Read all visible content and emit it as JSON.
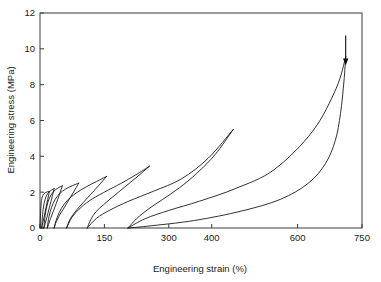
{
  "chart_data": {
    "type": "line",
    "title": "",
    "xlabel": "Engineering strain (%)",
    "ylabel": "Engineering stress (MPa)",
    "xlim": [
      0,
      750
    ],
    "ylim": [
      0,
      12
    ],
    "xticks": [
      0,
      150,
      300,
      400,
      600,
      750
    ],
    "xtick_labels": [
      "0",
      "150",
      "300",
      "400",
      "600",
      "750"
    ],
    "yticks": [
      0,
      2,
      4,
      6,
      8,
      10,
      12
    ],
    "ytick_labels": [
      "0",
      "2",
      "4",
      "6",
      "8",
      "10",
      "12"
    ],
    "grid": false,
    "legend": false,
    "annotations": [
      {
        "name": "unload-arrow",
        "x": 712,
        "y": 9.3,
        "direction": "down"
      }
    ],
    "series": [
      {
        "name": "cycle-1",
        "peak_strain": 22,
        "peak_stress": 2.05,
        "residual_strain": 4,
        "loading": [
          [
            0,
            0
          ],
          [
            1.5,
            0.9
          ],
          [
            3,
            1.45
          ],
          [
            5,
            1.72
          ],
          [
            8,
            1.88
          ],
          [
            12,
            1.97
          ],
          [
            17,
            2.02
          ],
          [
            22,
            2.05
          ]
        ],
        "unloading": [
          [
            22,
            2.05
          ],
          [
            18,
            1.6
          ],
          [
            14,
            1.15
          ],
          [
            11,
            0.78
          ],
          [
            8.5,
            0.5
          ],
          [
            6.5,
            0.28
          ],
          [
            5,
            0.13
          ],
          [
            4,
            0
          ]
        ]
      },
      {
        "name": "cycle-2",
        "peak_strain": 33,
        "peak_stress": 2.2,
        "residual_strain": 9,
        "loading": [
          [
            4,
            0
          ],
          [
            6,
            0.75
          ],
          [
            9,
            1.3
          ],
          [
            13,
            1.68
          ],
          [
            18,
            1.93
          ],
          [
            24,
            2.07
          ],
          [
            29,
            2.15
          ],
          [
            33,
            2.2
          ]
        ],
        "unloading": [
          [
            33,
            2.2
          ],
          [
            28,
            1.72
          ],
          [
            23,
            1.25
          ],
          [
            19,
            0.88
          ],
          [
            16,
            0.58
          ],
          [
            13,
            0.33
          ],
          [
            11,
            0.15
          ],
          [
            9,
            0
          ]
        ]
      },
      {
        "name": "cycle-3",
        "peak_strain": 52,
        "peak_stress": 2.35,
        "residual_strain": 17,
        "loading": [
          [
            9,
            0
          ],
          [
            12,
            0.7
          ],
          [
            16,
            1.22
          ],
          [
            21,
            1.62
          ],
          [
            28,
            1.93
          ],
          [
            36,
            2.13
          ],
          [
            44,
            2.26
          ],
          [
            52,
            2.35
          ]
        ],
        "unloading": [
          [
            52,
            2.35
          ],
          [
            45,
            1.85
          ],
          [
            38,
            1.38
          ],
          [
            32,
            1.0
          ],
          [
            27,
            0.68
          ],
          [
            23,
            0.42
          ],
          [
            20,
            0.2
          ],
          [
            17,
            0
          ]
        ]
      },
      {
        "name": "cycle-4",
        "peak_strain": 90,
        "peak_stress": 2.5,
        "residual_strain": 33,
        "loading": [
          [
            17,
            0
          ],
          [
            21,
            0.65
          ],
          [
            27,
            1.15
          ],
          [
            35,
            1.58
          ],
          [
            46,
            1.93
          ],
          [
            60,
            2.18
          ],
          [
            75,
            2.36
          ],
          [
            90,
            2.5
          ]
        ],
        "unloading": [
          [
            90,
            2.5
          ],
          [
            78,
            2.0
          ],
          [
            66,
            1.52
          ],
          [
            56,
            1.12
          ],
          [
            47,
            0.78
          ],
          [
            41,
            0.5
          ],
          [
            36,
            0.25
          ],
          [
            33,
            0
          ]
        ]
      },
      {
        "name": "cycle-5",
        "peak_strain": 155,
        "peak_stress": 2.88,
        "residual_strain": 62,
        "loading": [
          [
            33,
            0
          ],
          [
            40,
            0.6
          ],
          [
            50,
            1.1
          ],
          [
            64,
            1.55
          ],
          [
            84,
            1.95
          ],
          [
            108,
            2.3
          ],
          [
            132,
            2.6
          ],
          [
            155,
            2.88
          ]
        ],
        "unloading": [
          [
            155,
            2.88
          ],
          [
            136,
            2.35
          ],
          [
            117,
            1.85
          ],
          [
            100,
            1.4
          ],
          [
            86,
            1.02
          ],
          [
            75,
            0.68
          ],
          [
            67,
            0.34
          ],
          [
            62,
            0
          ]
        ]
      },
      {
        "name": "cycle-6",
        "peak_strain": 255,
        "peak_stress": 3.45,
        "residual_strain": 110,
        "loading": [
          [
            62,
            0
          ],
          [
            74,
            0.58
          ],
          [
            91,
            1.05
          ],
          [
            115,
            1.52
          ],
          [
            148,
            1.98
          ],
          [
            188,
            2.48
          ],
          [
            222,
            2.95
          ],
          [
            255,
            3.45
          ]
        ],
        "unloading": [
          [
            255,
            3.45
          ],
          [
            226,
            2.85
          ],
          [
            197,
            2.28
          ],
          [
            170,
            1.75
          ],
          [
            148,
            1.3
          ],
          [
            130,
            0.9
          ],
          [
            118,
            0.46
          ],
          [
            110,
            0
          ]
        ]
      },
      {
        "name": "cycle-7",
        "peak_strain": 450,
        "peak_stress": 5.5,
        "residual_strain": 205,
        "loading": [
          [
            110,
            0
          ],
          [
            132,
            0.55
          ],
          [
            163,
            1.0
          ],
          [
            207,
            1.5
          ],
          [
            264,
            2.05
          ],
          [
            330,
            2.75
          ],
          [
            392,
            3.9
          ],
          [
            450,
            5.5
          ]
        ],
        "unloading": [
          [
            450,
            5.5
          ],
          [
            408,
            4.1
          ],
          [
            365,
            3.05
          ],
          [
            325,
            2.25
          ],
          [
            286,
            1.6
          ],
          [
            252,
            1.05
          ],
          [
            225,
            0.52
          ],
          [
            205,
            0
          ]
        ]
      },
      {
        "name": "cycle-8",
        "peak_strain": 712,
        "peak_stress": 9.55,
        "residual_strain": 710,
        "loading": [
          [
            205,
            0
          ],
          [
            245,
            0.52
          ],
          [
            300,
            0.98
          ],
          [
            372,
            1.5
          ],
          [
            455,
            2.2
          ],
          [
            545,
            3.25
          ],
          [
            635,
            5.4
          ],
          [
            690,
            7.8
          ],
          [
            712,
            9.55
          ]
        ],
        "unloading": [
          [
            712,
            9.55
          ],
          [
            708,
            8.2
          ],
          [
            700,
            6.4
          ],
          [
            688,
            4.9
          ],
          [
            665,
            3.6
          ],
          [
            625,
            2.5
          ],
          [
            560,
            1.6
          ],
          [
            470,
            0.95
          ],
          [
            360,
            0.42
          ],
          [
            250,
            0.1
          ],
          [
            205,
            0
          ]
        ]
      }
    ]
  },
  "axis": {
    "xlabel": "Engineering strain (%)",
    "ylabel": "Engineering stress (MPa)"
  }
}
